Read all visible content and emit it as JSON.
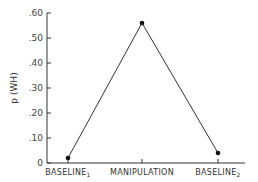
{
  "chart_data": {
    "type": "line",
    "title": "",
    "xlabel": "",
    "ylabel": "p (WH)",
    "categories": [
      "BASELINE1",
      "MANIPULATION",
      "BASELINE2"
    ],
    "category_display": [
      {
        "main": "BASELINE",
        "sub": "1"
      },
      {
        "main": "MANIPULATION",
        "sub": ""
      },
      {
        "main": "BASELINE",
        "sub": "2"
      }
    ],
    "values": [
      0.02,
      0.56,
      0.04
    ],
    "ylim": [
      0,
      0.6
    ],
    "yticks": [
      0,
      0.1,
      0.2,
      0.3,
      0.4,
      0.5,
      0.6
    ],
    "ytick_labels": [
      "0",
      ".10",
      ".20",
      ".30",
      ".40",
      ".50",
      ".60"
    ],
    "grid": false,
    "legend": null
  },
  "colors": {
    "line": "#333333",
    "marker": "#111111",
    "axis": "#333333"
  }
}
